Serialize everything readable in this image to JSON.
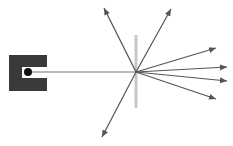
{
  "diagram": {
    "colors": {
      "background": "#ffffff",
      "source_box": "#3a3a3a",
      "source_dot": "#111111",
      "beam": "#777777",
      "grating": "#c8c8c8",
      "rays": "#555555"
    },
    "source": {
      "box": {
        "x": 9,
        "y": 55,
        "w": 38,
        "h": 36
      },
      "notch": {
        "x": 22,
        "y": 67,
        "w": 25,
        "h": 11
      },
      "dot": {
        "cx": 28,
        "cy": 72,
        "r": 4
      }
    },
    "beam": {
      "x1": 28,
      "y1": 72,
      "x2": 136,
      "y2": 72
    },
    "grating": {
      "x": 136,
      "y1": 35,
      "y2": 108,
      "width": 3
    },
    "origin": {
      "x": 136,
      "y": 72
    },
    "rays": [
      {
        "name": "ray-up-left",
        "x2": 104,
        "y2": 8
      },
      {
        "name": "ray-up-right",
        "x2": 171,
        "y2": 9
      },
      {
        "name": "ray-right-1",
        "x2": 216,
        "y2": 48
      },
      {
        "name": "ray-right-2",
        "x2": 227,
        "y2": 67
      },
      {
        "name": "ray-right-3",
        "x2": 227,
        "y2": 81
      },
      {
        "name": "ray-right-4",
        "x2": 216,
        "y2": 99
      },
      {
        "name": "ray-down-left",
        "x2": 102,
        "y2": 137
      }
    ]
  }
}
